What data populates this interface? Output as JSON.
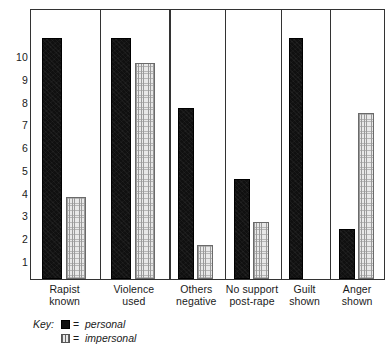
{
  "chart_data": {
    "type": "bar",
    "title": "",
    "xlabel": "",
    "ylabel": "",
    "ylim": [
      0,
      11.5
    ],
    "grid": false,
    "legend_position": "bottom-left",
    "yticks": [
      "10",
      "9",
      "8",
      "7",
      "6",
      "5",
      "4",
      "3",
      "2",
      "1"
    ],
    "ytick_values": [
      10,
      9,
      8,
      7,
      6,
      5,
      4,
      3,
      2,
      1
    ],
    "categories": [
      "Rapist known",
      "Violence used",
      "Others negative",
      "No support post-rape",
      "Guilt shown",
      "Anger shown"
    ],
    "category_lines": [
      [
        "Rapist",
        "known"
      ],
      [
        "Violence",
        "used"
      ],
      [
        "Others",
        "negative"
      ],
      [
        "No support",
        "post-rape"
      ],
      [
        "Guilt",
        "shown"
      ],
      [
        "Anger",
        "shown"
      ]
    ],
    "series": [
      {
        "name": "personal",
        "color": "#101010",
        "values": [
          10.8,
          10.8,
          7.7,
          4.6,
          10.8,
          2.4
        ]
      },
      {
        "name": "impersonal",
        "color": "#e8e8e8",
        "values": [
          3.8,
          9.7,
          1.7,
          2.7,
          null,
          7.5
        ]
      }
    ]
  },
  "legend": {
    "key_label": "Key:",
    "equals": "=",
    "rows": [
      {
        "swatch": "personal",
        "label": "personal"
      },
      {
        "swatch": "impersonal",
        "label": "impersonal"
      }
    ]
  },
  "colors": {
    "personal": "#101010",
    "impersonal": "#e8e8e8",
    "axis": "#333333",
    "text": "#1a1a1a",
    "background": "#ffffff"
  }
}
